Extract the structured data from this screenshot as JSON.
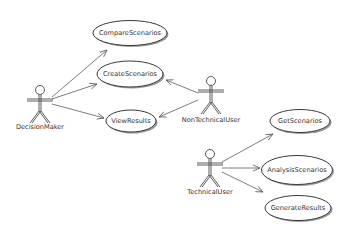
{
  "diagram": {
    "type": "uml-use-case",
    "colors": {
      "stroke": "#3a3a3a",
      "shadow": "#9a9a9a",
      "text": "#333333",
      "background": "#ffffff"
    },
    "actors": [
      {
        "id": "DecisionMaker",
        "label": "DecisionMaker",
        "x": 40,
        "y": 90,
        "label_y": 129
      },
      {
        "id": "NonTechnicalUser",
        "label": "NonTechnicalUser",
        "x": 211,
        "y": 81,
        "label_y": 122
      },
      {
        "id": "TechnicalUser",
        "label": "TechnicalUser",
        "x": 210,
        "y": 154,
        "label_y": 194
      }
    ],
    "use_cases": [
      {
        "id": "CompareScenarios",
        "label": "CompareScenarios",
        "cx": 130,
        "cy": 33,
        "rx": 37,
        "ry": 12.5
      },
      {
        "id": "CreateScenarios",
        "label": "CreateScenarios",
        "cx": 130,
        "cy": 74,
        "rx": 33,
        "ry": 13
      },
      {
        "id": "ViewResults",
        "label": "ViewResults",
        "cx": 131,
        "cy": 121,
        "rx": 25,
        "ry": 11
      },
      {
        "id": "GetScenarios",
        "label": "GetScenarios",
        "cx": 300,
        "cy": 121,
        "rx": 30,
        "ry": 11.5
      },
      {
        "id": "AnalysisScenarios",
        "label": "AnalysisScenarios",
        "cx": 297,
        "cy": 170,
        "rx": 35.5,
        "ry": 14.5
      },
      {
        "id": "GenerateResults",
        "label": "GenerateResults",
        "cx": 298,
        "cy": 208,
        "rx": 33,
        "ry": 12.5
      }
    ],
    "associations": [
      {
        "from": "DecisionMaker",
        "to": "CompareScenarios",
        "x1": 52,
        "y1": 97,
        "x2": 107,
        "y2": 50
      },
      {
        "from": "DecisionMaker",
        "to": "CreateScenarios",
        "x1": 52,
        "y1": 99,
        "x2": 97,
        "y2": 84
      },
      {
        "from": "DecisionMaker",
        "to": "ViewResults",
        "x1": 52,
        "y1": 104,
        "x2": 104,
        "y2": 118
      },
      {
        "from": "NonTechnicalUser",
        "to": "CreateScenarios",
        "x1": 198,
        "y1": 93,
        "x2": 166,
        "y2": 80
      },
      {
        "from": "NonTechnicalUser",
        "to": "ViewResults",
        "x1": 198,
        "y1": 100,
        "x2": 159,
        "y2": 117
      },
      {
        "from": "TechnicalUser",
        "to": "GetScenarios",
        "x1": 222,
        "y1": 162,
        "x2": 273,
        "y2": 134
      },
      {
        "from": "TechnicalUser",
        "to": "AnalysisScenarios",
        "x1": 222,
        "y1": 168,
        "x2": 260,
        "y2": 168
      },
      {
        "from": "TechnicalUser",
        "to": "GenerateResults",
        "x1": 222,
        "y1": 172,
        "x2": 263,
        "y2": 192
      }
    ]
  }
}
